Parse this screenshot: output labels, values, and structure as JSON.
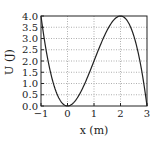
{
  "chart_data": {
    "type": "line",
    "title": "",
    "xlabel": "x (m)",
    "ylabel": "U (J)",
    "xlim": [
      -1,
      3
    ],
    "ylim": [
      0,
      4.0
    ],
    "grid": true,
    "legend": null,
    "x_ticks": [
      "−1",
      "0",
      "1",
      "2",
      "3"
    ],
    "y_ticks": [
      "0.0",
      "0.5",
      "1.0",
      "1.5",
      "2.0",
      "2.5",
      "3.0",
      "3.5",
      "4.0"
    ],
    "series": [
      {
        "name": "U(x)",
        "x": [
          -1,
          -0.5,
          0,
          0.5,
          1,
          1.5,
          2,
          2.5,
          3
        ],
        "values": [
          4.0,
          0.875,
          0.0,
          0.625,
          2.0,
          3.375,
          4.0,
          3.125,
          0.0
        ]
      }
    ],
    "annotations": []
  },
  "colors": {
    "curve": "#222222",
    "grid": "#9a9a9a",
    "axis": "#222222"
  }
}
